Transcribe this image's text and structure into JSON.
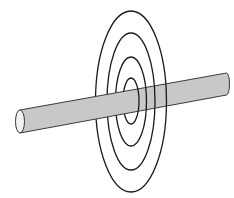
{
  "diagram": {
    "background": "#ffffff",
    "conductor": {
      "fill": "#c8c8c8",
      "stroke": "#3a3a3a",
      "end_cap_fill": "#f2f2f2",
      "left_end": {
        "cx": 20,
        "cy": 121.5,
        "rx": 4.5,
        "ry": 11.5
      },
      "right_end": {
        "cx": 226.5,
        "cy": 84,
        "rx": 3,
        "ry": 11
      }
    },
    "field_lines": {
      "stroke": "#1a1a1a",
      "count": 4,
      "rings": [
        {
          "cx": 131,
          "cy": 101.5,
          "rx": 35.5,
          "ry": 90.5
        },
        {
          "cx": 131,
          "cy": 101.5,
          "rx": 24,
          "ry": 68.5
        },
        {
          "cx": 131,
          "cy": 101.5,
          "rx": 15.5,
          "ry": 44.5
        },
        {
          "cx": 131,
          "cy": 101,
          "rx": 8,
          "ry": 23
        }
      ]
    }
  }
}
